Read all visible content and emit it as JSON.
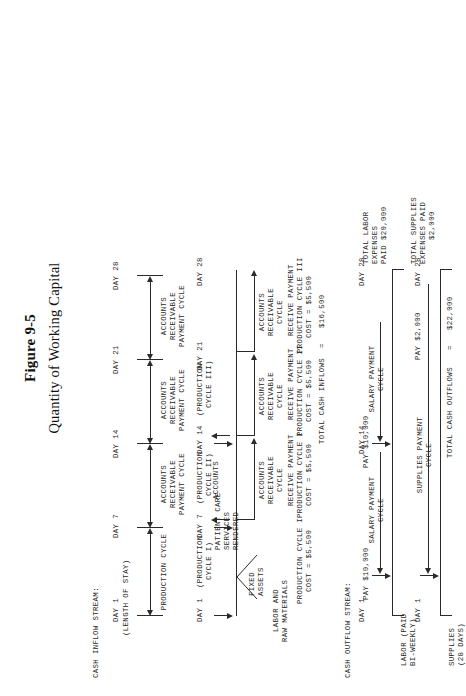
{
  "figure": {
    "number": "Figure 9-5",
    "title": "Quantity of Working Capital"
  },
  "sections": {
    "inflow_label": "CASH INFLOW STREAM:",
    "outflow_label": "CASH OUTFLOW STREAM:"
  },
  "inflow": {
    "timeline_a": {
      "day1": "DAY 1",
      "day1_sub": "(LENGTH OF STAY)",
      "day7": "DAY 7",
      "day14": "DAY 14",
      "day21": "DAY 21",
      "day28": "DAY 28",
      "span1_label": "PRODUCTION CYCLE",
      "span2_line1": "ACCOUNTS",
      "span2_line2": "RECEIVABLE",
      "span2_line3": "PAYMENT CYCLE",
      "span3_line1": "ACCOUNTS",
      "span3_line2": "RECEIVABLE",
      "span3_line3": "PAYMENT CYCLE"
    },
    "timeline_b": {
      "day1": "DAY 1",
      "day1_sub1": "(PRODUCTION",
      "day1_sub2": "CYCLE I)",
      "day7": "DAY 7",
      "day7_sub1": "(PRODUCTION",
      "day7_sub2": "CYCLE II)",
      "day14": "DAY 14",
      "day14_sub1": "(PRODUCTION",
      "day14_sub2": "CYCLE III)",
      "day21": "DAY 21",
      "day28": "DAY 28",
      "funnel_line1": "PATIENT CARE",
      "funnel_line2": "SERVICES",
      "funnel_line3": "RENDERED",
      "input_fixed_1": "FIXED",
      "input_fixed_2": "ASSETS",
      "input_labor_1": "LABOR AND",
      "input_labor_2": "RAW MATERIALS",
      "ar_cycle1_l1": "ACCOUNTS",
      "ar_cycle1_l2": "RECEIVABLE",
      "ar_cycle1_l3": "CYCLE",
      "ar_cycle2_l1": "ACCOUNTS",
      "ar_cycle2_l2": "RECEIVABLE",
      "ar_cycle2_l3": "CYCLE",
      "ar_cycle3_l1": "ACCOUNTS",
      "ar_cycle3_l2": "RECEIVABLE",
      "ar_cycle3_l3": "CYCLE"
    },
    "payments": [
      {
        "line1": "RECEIVE PAYMENT",
        "line2": "PRODUCTION CYCLE I",
        "line3": "COST = $5,500"
      },
      {
        "line1": "RECEIVE PAYMENT",
        "line2": "PRODUCTION CYCLE II",
        "line3": "COST = $5,500"
      },
      {
        "line1": "RECEIVE PAYMENT",
        "line2": "PRODUCTION CYCLE III",
        "line3": "COST = $5,500"
      }
    ],
    "cost_note": {
      "line1": "PRODUCTION CYCLE I",
      "line2": "COST = $5,500"
    },
    "total_label": "TOTAL CASH INFLOWS",
    "total_equals": "=",
    "total_value": "$16,500"
  },
  "outflow": {
    "labor": {
      "day_start": "DAY 1",
      "day_end": "DAY 28",
      "row_label_1": "LABOR (PAID",
      "row_label_2": "BI-WEEKLY)",
      "cycle_line1": "SALARY PAYMENT",
      "cycle_line2": "CYCLE",
      "pay_first": "PAY $10,000",
      "pay_second": "PAY $10,000",
      "cycle2_line1": "SALARY PAYMENT",
      "cycle2_line2": "CYCLE",
      "total_line1": "TOTAL LABOR",
      "total_line2": "EXPENSES",
      "total_line3": "PAID $20,000"
    },
    "supplies": {
      "day_start": "DAY 1",
      "day_end": "DAY 28",
      "row_label_1": "SUPPLIES",
      "row_label_2": "(28 DAYS)",
      "cycle_line1": "SUPPLIES PAYMENT",
      "cycle_line2": "CYCLE",
      "pay": "PAY $2,000",
      "total_line1": "TOTAL SUPPLIES",
      "total_line2": "EXPENSES PAID",
      "total_line3": "$2,000"
    },
    "total_label": "TOTAL CASH OUTFLOWS",
    "total_equals": "=",
    "total_value": "$22,000"
  }
}
